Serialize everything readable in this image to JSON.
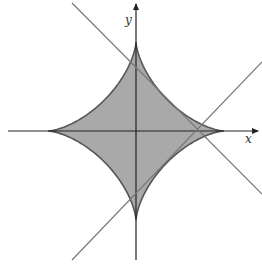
{
  "diagram": {
    "x_axis_label": "x",
    "y_axis_label": "y",
    "colors": {
      "fill": "#a9a9a9",
      "curve": "#555555",
      "axes": "#222222",
      "lines": "#777777"
    },
    "shapes": [
      {
        "type": "astroid",
        "center": [
          136,
          131
        ],
        "half_width": 88,
        "half_height": 89,
        "filled": true
      },
      {
        "type": "line",
        "from": [
          72,
          3
        ],
        "to": [
          262,
          194
        ]
      },
      {
        "type": "line",
        "from": [
          72,
          260
        ],
        "to": [
          262,
          62
        ]
      }
    ]
  }
}
